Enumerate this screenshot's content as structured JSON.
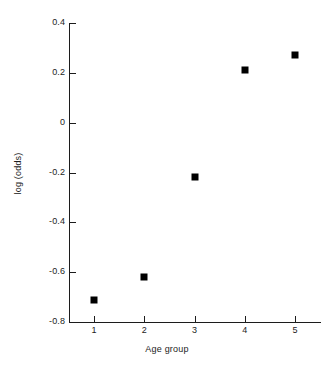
{
  "chart_data": {
    "type": "scatter",
    "title": "",
    "xlabel": "Age group",
    "ylabel": "log (odds)",
    "x": [
      1,
      2,
      3,
      4,
      5
    ],
    "values": [
      -0.71,
      -0.62,
      -0.22,
      0.21,
      0.27
    ],
    "categories": [
      "1",
      "2",
      "3",
      "4",
      "5"
    ],
    "xlim": [
      0.5,
      5.5
    ],
    "ylim": [
      -0.8,
      0.4
    ],
    "xticks": [
      "1",
      "2",
      "3",
      "4",
      "5"
    ],
    "yticks": [
      "0.4",
      "0.2",
      "0",
      "-0.2",
      "-0.4",
      "-0.6",
      "-0.8"
    ],
    "ytick_values": [
      0.4,
      0.2,
      0,
      -0.2,
      -0.4,
      -0.6,
      -0.8
    ],
    "grid": false,
    "legend": null,
    "marker": "square",
    "marker_color": "#000000",
    "axis_color": "#1c1c1c",
    "background": "#ffffff",
    "series": [
      {
        "name": "log (odds) by age group",
        "points": [
          {
            "x": 1,
            "y": -0.71
          },
          {
            "x": 2,
            "y": -0.62
          },
          {
            "x": 3,
            "y": -0.22
          },
          {
            "x": 4,
            "y": 0.21
          },
          {
            "x": 5,
            "y": 0.27
          }
        ]
      }
    ]
  }
}
